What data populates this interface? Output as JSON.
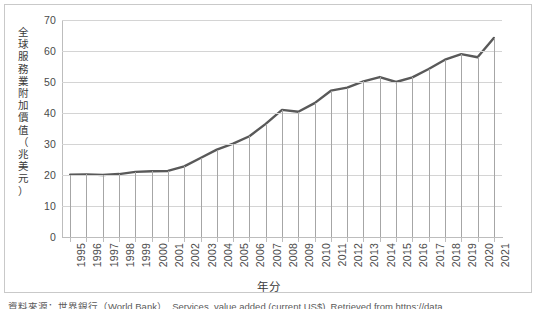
{
  "chart_data": {
    "type": "line",
    "title": "",
    "xlabel": "年分",
    "ylabel": "全球服務業附加價值（兆美元）",
    "ylabel_chars": [
      "全",
      "球",
      "服",
      "務",
      "業",
      "附",
      "加",
      "價",
      "值",
      "（",
      "兆",
      "美",
      "元",
      "）"
    ],
    "categories": [
      "1995",
      "1996",
      "1997",
      "1998",
      "1999",
      "2000",
      "2001",
      "2002",
      "2003",
      "2004",
      "2005",
      "2006",
      "2007",
      "2008",
      "2009",
      "2010",
      "2011",
      "2012",
      "2013",
      "2014",
      "2015",
      "2016",
      "2017",
      "2018",
      "2019",
      "2020",
      "2021"
    ],
    "values": [
      20.1,
      20.2,
      20.0,
      20.3,
      21.0,
      21.2,
      21.3,
      22.8,
      25.5,
      28.2,
      30.1,
      32.5,
      36.5,
      41.0,
      40.4,
      43.2,
      47.2,
      48.2,
      50.2,
      51.6,
      50.0,
      51.5,
      54.2,
      57.2,
      59.0,
      58.0,
      64.2
    ],
    "ytick_labels": [
      "0",
      "10",
      "20",
      "30",
      "40",
      "50",
      "60",
      "70"
    ],
    "ytick_values": [
      0,
      10,
      20,
      30,
      40,
      50,
      60,
      70
    ],
    "ylim": [
      0,
      70
    ],
    "grid": true,
    "legend": "none",
    "line_color": "#595959",
    "grid_color": "#d4d4d4",
    "dropline_color": "#a6a6a6",
    "axis_color": "#bdbdbd",
    "drop_lines": true
  },
  "caption": {
    "text": "資料來源：世界銀行（World Bank）. Services, value added (current US$). Retrieved from https://data"
  }
}
